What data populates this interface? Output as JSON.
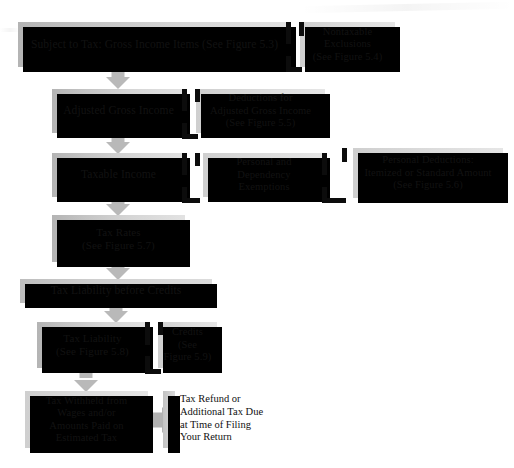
{
  "figure": {
    "background_color": "#ffffff",
    "box_fill_light": "#e2e2e2",
    "box_fill_dark": "#b4b4b4",
    "shadow_color": "#000000",
    "arrow_color": "#b9b9b9",
    "text_color": "#121212"
  },
  "nodes": {
    "gross_income": {
      "label": "Subject to Tax: Gross Income Items (See Figure 5.3)",
      "x": 18,
      "y": 22,
      "w": 273,
      "h": 45,
      "font_size": 11.5
    },
    "nontaxable_exclusions": {
      "label": "Nontaxable\nExclusions\n(See Figure 5.4)",
      "x": 300,
      "y": 22,
      "w": 95,
      "h": 45,
      "font_size": 10.5
    },
    "adjusted_gross_income": {
      "label": "Adjusted Gross Income",
      "x": 52,
      "y": 89,
      "w": 133,
      "h": 44,
      "font_size": 11.5
    },
    "deductions_for_agi": {
      "label": "Deductions for\nAdjusted Gross Income\n(See Figure 5.5)",
      "x": 196,
      "y": 89,
      "w": 129,
      "h": 44,
      "font_size": 10.5
    },
    "taxable_income": {
      "label": "Taxable Income",
      "x": 52,
      "y": 153,
      "w": 133,
      "h": 44,
      "font_size": 11.5
    },
    "personal_exemptions": {
      "label": "Personal and\nDependency\nExemptions",
      "x": 203,
      "y": 153,
      "w": 122,
      "h": 44,
      "font_size": 10.5
    },
    "personal_deductions": {
      "label": "Personal Deductions:\nItemized or Standard Amount\n(See Figure 5.6)",
      "x": 353,
      "y": 148,
      "w": 150,
      "h": 50,
      "font_size": 10.5
    },
    "tax_rates": {
      "label": "Tax Rates\n(See Figure 5.7)",
      "x": 52,
      "y": 215,
      "w": 133,
      "h": 47,
      "font_size": 11
    },
    "tax_liability_before_credits": {
      "label": "Tax Liability before Credits",
      "x": 20,
      "y": 279,
      "w": 192,
      "h": 24,
      "font_size": 11.5
    },
    "tax_liability": {
      "label": "Tax Liability\n(See Figure 5.8)",
      "x": 37,
      "y": 322,
      "w": 111,
      "h": 46,
      "font_size": 11
    },
    "credits": {
      "label": "Credits\n(See\nFigure 5.9)",
      "x": 158,
      "y": 322,
      "w": 59,
      "h": 46,
      "font_size": 10.5
    },
    "tax_withheld": {
      "label": "Tax Withheld from\nWages and/or\nAmounts Paid on\nEstimated Tax",
      "x": 25,
      "y": 391,
      "w": 123,
      "h": 57,
      "font_size": 10.5
    },
    "tax_refund": {
      "label": "Tax Refund or\nAdditional Tax Due\nat Time of Filing\nYour Return",
      "x": 178,
      "y": 391,
      "w": 110,
      "h": 57,
      "font_size": 10.5
    }
  },
  "connectors": {
    "gross_to_nontaxable": {
      "label": "bracket-connector"
    },
    "agi_to_deductions": {
      "label": "bracket-connector"
    },
    "taxable_to_exemptions": {
      "label": "bracket-connector"
    },
    "exemptions_to_deductions": {
      "label": "bracket-connector"
    },
    "liability_to_credits": {
      "label": "bracket-connector"
    }
  },
  "arrows": {
    "a1": {
      "label": "arrow-gross-to-agi",
      "x": 106,
      "y": 67,
      "w": 24,
      "h": 22
    },
    "a2": {
      "label": "arrow-agi-to-taxable",
      "x": 106,
      "y": 133,
      "w": 24,
      "h": 20
    },
    "a3": {
      "label": "arrow-taxable-to-rates",
      "x": 106,
      "y": 197,
      "w": 24,
      "h": 18
    },
    "a4": {
      "label": "arrow-rates-to-liability-before-credits",
      "x": 106,
      "y": 262,
      "w": 24,
      "h": 17
    },
    "a5": {
      "label": "arrow-before-credits-to-liability",
      "x": 104,
      "y": 303,
      "w": 24,
      "h": 19
    },
    "a6": {
      "label": "arrow-liability-to-withheld",
      "x": 74,
      "y": 368,
      "w": 24,
      "h": 23
    },
    "a7": {
      "label": "arrow-withheld-to-refund",
      "x": 152,
      "y": 407,
      "w": 23,
      "h": 26
    }
  }
}
